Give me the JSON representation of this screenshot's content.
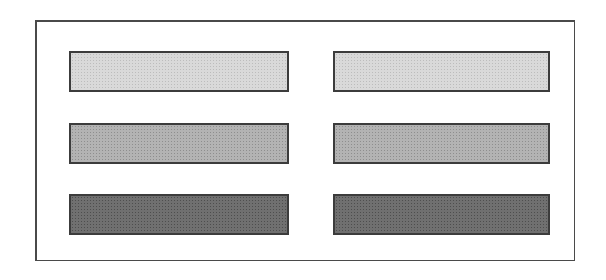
{
  "diagram": {
    "frame": {
      "border_color": "#4a4a4a"
    },
    "columns": [
      {
        "name": "left",
        "bars": [
          {
            "shade": "light",
            "fill": "#d9d9d9",
            "label": ""
          },
          {
            "shade": "medium",
            "fill": "#b3b3b3",
            "label": ""
          },
          {
            "shade": "dark",
            "fill": "#707070",
            "label": ""
          }
        ]
      },
      {
        "name": "right",
        "bars": [
          {
            "shade": "light",
            "fill": "#d9d9d9",
            "label": ""
          },
          {
            "shade": "medium",
            "fill": "#b3b3b3",
            "label": ""
          },
          {
            "shade": "dark",
            "fill": "#707070",
            "label": ""
          }
        ]
      }
    ]
  }
}
